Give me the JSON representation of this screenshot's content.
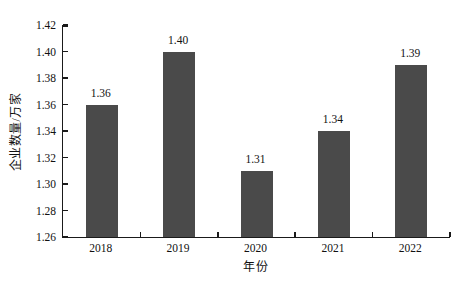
{
  "figure": {
    "background": "#ffffff",
    "bar_color": "#4a4a4a",
    "axis_color": "#1a1a1a",
    "text_color": "#111111"
  },
  "chart_data": {
    "type": "bar",
    "title": "",
    "xlabel": "年份",
    "ylabel": "企业数量/万家",
    "categories": [
      "2018",
      "2019",
      "2020",
      "2021",
      "2022"
    ],
    "values": [
      1.36,
      1.4,
      1.31,
      1.34,
      1.39
    ],
    "value_labels": [
      "1.36",
      "1.40",
      "1.31",
      "1.34",
      "1.39"
    ],
    "ylim": [
      1.26,
      1.42
    ],
    "ytick_step": 0.02,
    "ytick_labels": [
      "1.26",
      "1.28",
      "1.30",
      "1.32",
      "1.34",
      "1.36",
      "1.38",
      "1.40",
      "1.42"
    ],
    "grid": false,
    "legend": "none",
    "bar_width_px": 32
  }
}
